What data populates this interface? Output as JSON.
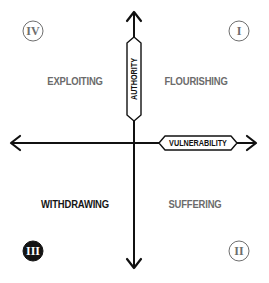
{
  "diagram": {
    "type": "quadrant",
    "axes": {
      "vertical": {
        "label": "AUTHORITY",
        "direction": "bidirectional"
      },
      "horizontal": {
        "label": "VULNERABILITY",
        "direction": "bidirectional"
      }
    },
    "quadrants": [
      {
        "numeral": "I",
        "label": "FLOURISHING",
        "position": "top-right",
        "emphasis": false
      },
      {
        "numeral": "II",
        "label": "SUFFERING",
        "position": "bottom-right",
        "emphasis": false
      },
      {
        "numeral": "III",
        "label": "WITHDRAWING",
        "position": "bottom-left",
        "emphasis": true
      },
      {
        "numeral": "IV",
        "label": "EXPLOITING",
        "position": "top-left",
        "emphasis": false
      }
    ],
    "colors": {
      "axis": "#111111",
      "muted_text": "#6b6b6b",
      "strong_text": "#151515",
      "filled_circle": "#141414",
      "background": "#ffffff"
    }
  }
}
